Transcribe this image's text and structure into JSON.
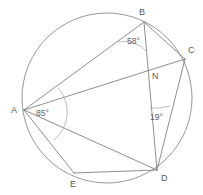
{
  "figure": {
    "stroke_color": "#7a7a7a",
    "circle_color": "#8b8b8b",
    "label_color": "#5a5a5a",
    "background": "#ffffff"
  },
  "circle": {
    "center_x": 107,
    "center_y": 98,
    "radius": 85
  },
  "points": {
    "A": {
      "label": "A",
      "x": 24,
      "y": 110,
      "label_x": 11,
      "label_y": 113
    },
    "B": {
      "label": "B",
      "x": 144,
      "y": 22,
      "label_x": 139,
      "label_y": 15
    },
    "C": {
      "label": "C",
      "x": 185,
      "y": 59,
      "label_x": 188,
      "label_y": 53
    },
    "D": {
      "label": "D",
      "x": 157,
      "y": 170,
      "label_x": 161,
      "label_y": 181
    },
    "E": {
      "label": "E",
      "x": 74,
      "y": 173,
      "label_x": 70,
      "label_y": 187
    },
    "N": {
      "label": "N",
      "x": 150,
      "y": 72,
      "label_x": 152,
      "label_y": 79
    }
  },
  "segments": [
    {
      "name": "chord-a-b",
      "from": "A",
      "to": "B"
    },
    {
      "name": "chord-a-c",
      "from": "A",
      "to": "C"
    },
    {
      "name": "chord-a-d",
      "from": "A",
      "to": "D"
    },
    {
      "name": "chord-a-e",
      "from": "A",
      "to": "E"
    },
    {
      "name": "chord-e-d",
      "from": "E",
      "to": "D"
    },
    {
      "name": "chord-b-d",
      "from": "B",
      "to": "D"
    },
    {
      "name": "chord-c-d",
      "from": "C",
      "to": "D"
    },
    {
      "name": "chord-b-c",
      "from": "B",
      "to": "C"
    }
  ],
  "angles": [
    {
      "name": "angle-at-b",
      "value": "58",
      "unit": "°",
      "text": "58°",
      "vertex": "B",
      "label_x": 127,
      "label_y": 44
    },
    {
      "name": "angle-at-a",
      "value": "85",
      "unit": "°",
      "text": "85°",
      "vertex": "A",
      "label_x": 36,
      "label_y": 116
    },
    {
      "name": "angle-at-d",
      "value": "19",
      "unit": "°",
      "text": "19°",
      "vertex": "D",
      "label_x": 150,
      "label_y": 120
    }
  ]
}
